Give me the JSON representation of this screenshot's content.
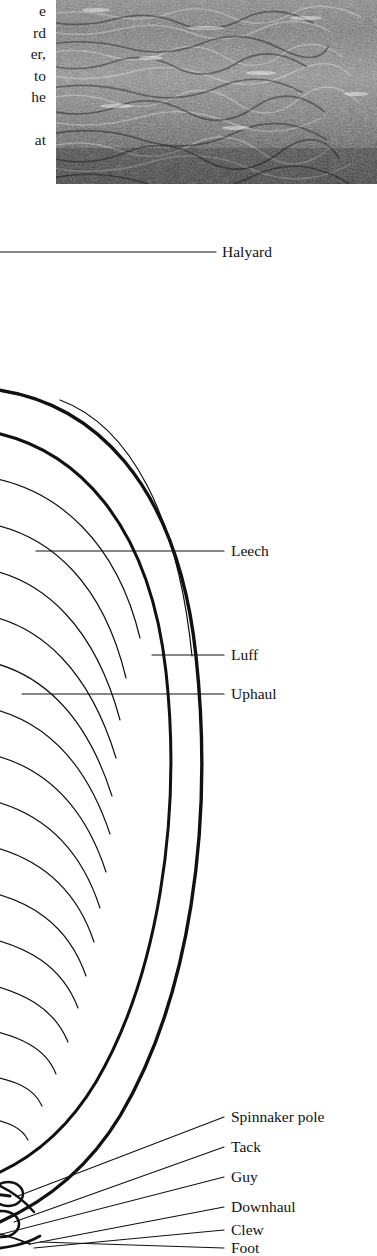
{
  "page": {
    "width": 377,
    "height": 1256,
    "background": "#ffffff",
    "ink": "#111111"
  },
  "body_text": {
    "note": "right-hand fragment of a text column cropped by the page edge",
    "lines": [
      "e",
      "rd",
      "er,",
      "to",
      "he"
    ],
    "trailing_line": "at"
  },
  "photo": {
    "name": "sea-surface-photograph",
    "description": "black and white halftone photograph of choppy water surface",
    "tone_dark": "#2b2b2b",
    "tone_mid": "#6f6f6f",
    "tone_light": "#d8d8d8"
  },
  "diagram": {
    "stroke": "#111111",
    "labels": [
      {
        "id": "halyard",
        "text": "Halyard",
        "x": 222,
        "y": 252
      },
      {
        "id": "leech",
        "text": "Leech",
        "x": 231,
        "y": 551
      },
      {
        "id": "luff",
        "text": "Luff",
        "x": 231,
        "y": 655
      },
      {
        "id": "uphaul",
        "text": "Uphaul",
        "x": 231,
        "y": 694
      },
      {
        "id": "spinnaker-pole",
        "text": "Spinnaker pole",
        "x": 231,
        "y": 1117
      },
      {
        "id": "tack",
        "text": "Tack",
        "x": 231,
        "y": 1147
      },
      {
        "id": "guy",
        "text": "Guy",
        "x": 231,
        "y": 1177
      },
      {
        "id": "downhaul",
        "text": "Downhaul",
        "x": 231,
        "y": 1207
      },
      {
        "id": "clew",
        "text": "Clew",
        "x": 231,
        "y": 1230
      },
      {
        "id": "foot",
        "text": "Foot",
        "x": 231,
        "y": 1248
      }
    ]
  }
}
